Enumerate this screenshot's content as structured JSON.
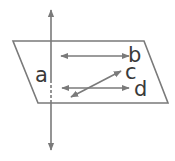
{
  "diagram": {
    "labels": {
      "a": "a",
      "b": "b",
      "c": "c",
      "d": "d"
    },
    "colors": {
      "line": "#7a7a7a",
      "text": "#3a3a3a",
      "background": "#ffffff"
    },
    "plane": {
      "shape": "parallelogram",
      "vertices": [
        [
          13,
          41
        ],
        [
          144,
          41
        ],
        [
          168,
          103
        ],
        [
          38,
          103
        ]
      ]
    },
    "lines": [
      {
        "name": "a",
        "type": "vertical double-arrow",
        "from": [
          51,
          10
        ],
        "to": [
          51,
          150
        ],
        "dashed_segment": [
          80,
          103
        ]
      },
      {
        "name": "b",
        "type": "horizontal double-arrow",
        "from": [
          61,
          56
        ],
        "to": [
          129,
          56
        ]
      },
      {
        "name": "c",
        "type": "diagonal double-arrow",
        "from": [
          71,
          97
        ],
        "to": [
          121,
          71
        ]
      },
      {
        "name": "d",
        "type": "horizontal double-arrow",
        "from": [
          62,
          88
        ],
        "to": [
          129,
          88
        ]
      }
    ]
  }
}
